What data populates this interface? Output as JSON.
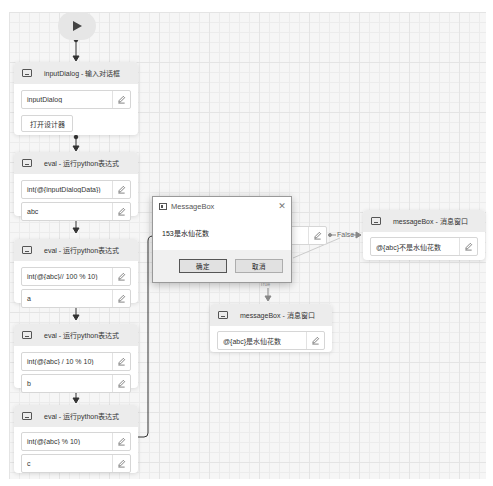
{
  "canvas": {
    "start_node": {
      "icon": "play-icon"
    },
    "nodes": [
      {
        "id": "inputDialog",
        "title": "inputDialog - 输入对话框",
        "icon": "input-dialog-icon",
        "fields": [
          "inputDialog"
        ],
        "button_label": "打开设计器"
      },
      {
        "id": "eval1",
        "title": "eval - 运行python表达式",
        "icon": "eval-icon",
        "fields": [
          "int(@{inputDialogData})",
          "abc"
        ]
      },
      {
        "id": "eval2",
        "title": "eval - 运行python表达式",
        "icon": "eval-icon",
        "fields": [
          "int(@{abc}// 100 % 10)",
          "a"
        ]
      },
      {
        "id": "eval3",
        "title": "eval - 运行python表达式",
        "icon": "eval-icon",
        "fields": [
          "int(@{abc} / 10 % 10)",
          "b"
        ]
      },
      {
        "id": "eval4",
        "title": "eval - 运行python表达式",
        "icon": "eval-icon",
        "fields": [
          "int(@{abc}  % 10)",
          "c"
        ]
      },
      {
        "id": "msgTrue",
        "title": "messageBox - 消息窗口",
        "icon": "message-icon",
        "fields": [
          "@{abc}是水仙花数"
        ]
      },
      {
        "id": "msgFalse",
        "title": "messageBox - 消息窗口",
        "icon": "message-icon",
        "fields": [
          "@{abc}不是水仙花数"
        ]
      }
    ],
    "edges": {
      "false_label": "False",
      "true_label": "True"
    }
  },
  "dialog": {
    "title": "MessageBox",
    "message": "153是水仙花数",
    "ok_label": "确定",
    "cancel_label": "取消",
    "close_glyph": "✕"
  }
}
